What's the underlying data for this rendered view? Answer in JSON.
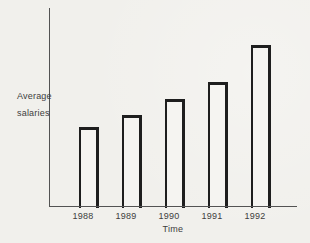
{
  "chart_data": {
    "type": "bar",
    "categories": [
      "1988",
      "1989",
      "1990",
      "1991",
      "1992"
    ],
    "values": [
      79,
      91,
      107,
      124,
      161
    ],
    "title": "",
    "xlabel": "Time",
    "ylabel": "Average salaries",
    "ylabel_lines": [
      "Average",
      "salaries"
    ],
    "ylim": [
      0,
      198
    ],
    "grid": "off",
    "legend": "none",
    "bar_fill": "#f5f4f1",
    "bar_outline": "#1e1e1e",
    "axis_color": "#535353",
    "text_color": "#3d3d3d",
    "paper_color": "#f1f0ec"
  }
}
